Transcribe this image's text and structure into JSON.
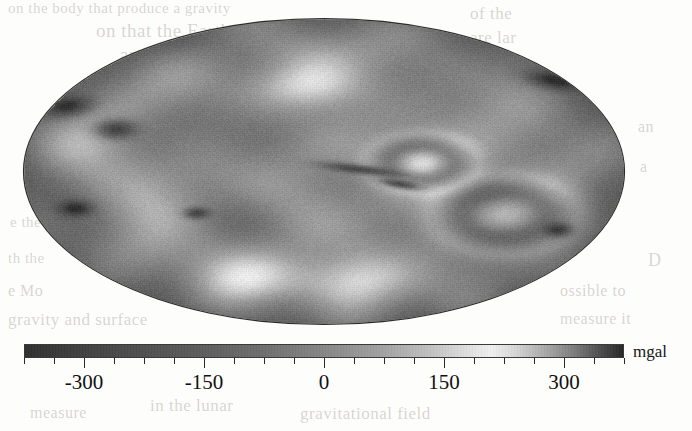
{
  "figure": {
    "kind": "gravity-anomaly-map",
    "projection": "Mollweide",
    "colormap": "grayscale-cyclic"
  },
  "colorbar": {
    "unit_label": "mgal",
    "min": -375,
    "max": 375,
    "tick_labels": [
      "-300",
      "-150",
      "0",
      "150",
      "300"
    ],
    "tick_values": [
      -300,
      -150,
      0,
      150,
      300
    ],
    "minor_step": 37.5,
    "low_color": "#2f2f2f",
    "mid_color": "#f0f0f0",
    "high_color": "#262626"
  },
  "bleed_through": [
    {
      "text": "on the body that produce a gravity",
      "x": 8,
      "y": 0,
      "size": 15,
      "mirror": false
    },
    {
      "text": "on that the Earth and could not",
      "x": 96,
      "y": 20,
      "size": 19,
      "mirror": false
    },
    {
      "text": "are large",
      "x": 120,
      "y": 44,
      "size": 19,
      "mirror": false
    },
    {
      "text": "of the",
      "x": 470,
      "y": 4,
      "size": 17,
      "mirror": false
    },
    {
      "text": "are lar",
      "x": 470,
      "y": 28,
      "size": 17,
      "mirror": false
    },
    {
      "text": "er and pro",
      "x": 430,
      "y": 60,
      "size": 17,
      "mirror": false
    },
    {
      "text": "an",
      "x": 638,
      "y": 118,
      "size": 16,
      "mirror": false
    },
    {
      "text": "a",
      "x": 640,
      "y": 158,
      "size": 16,
      "mirror": false
    },
    {
      "text": "e the",
      "x": 10,
      "y": 214,
      "size": 15,
      "mirror": false
    },
    {
      "text": "th the",
      "x": 8,
      "y": 250,
      "size": 15,
      "mirror": false
    },
    {
      "text": "e Mo",
      "x": 8,
      "y": 282,
      "size": 16,
      "mirror": false
    },
    {
      "text": "gravity and surface",
      "x": 8,
      "y": 310,
      "size": 17,
      "mirror": false
    },
    {
      "text": "D",
      "x": 648,
      "y": 250,
      "size": 18,
      "mirror": false
    },
    {
      "text": "ossible to",
      "x": 560,
      "y": 282,
      "size": 16,
      "mirror": false
    },
    {
      "text": "measure it",
      "x": 560,
      "y": 310,
      "size": 16,
      "mirror": false
    },
    {
      "text": "in the lunar",
      "x": 150,
      "y": 396,
      "size": 17,
      "mirror": false
    },
    {
      "text": "measure",
      "x": 30,
      "y": 404,
      "size": 16,
      "mirror": false
    },
    {
      "text": "gravitational field",
      "x": 300,
      "y": 404,
      "size": 17,
      "mirror": false
    }
  ],
  "chart_data": {
    "type": "heatmap",
    "title": "",
    "xlabel": "",
    "ylabel": "",
    "colorbar_label": "mgal",
    "colorbar_ticks": [
      -300,
      -150,
      0,
      150,
      300
    ],
    "value_range": [
      -375,
      375
    ],
    "projection": "Mollweide",
    "grid": false,
    "legend": "colorbar-below",
    "background_level": 15,
    "features": [
      {
        "name": "mascon-a",
        "cx": 0.073,
        "cy": 0.285,
        "rx": 0.04,
        "ry": 0.03,
        "rot": -28,
        "value": -330
      },
      {
        "name": "mascon-b",
        "cx": 0.152,
        "cy": 0.36,
        "rx": 0.032,
        "ry": 0.03,
        "rot": 0,
        "value": -340
      },
      {
        "name": "mascon-c",
        "cx": 0.085,
        "cy": 0.62,
        "rx": 0.027,
        "ry": 0.026,
        "rot": 0,
        "value": -325
      },
      {
        "name": "mascon-d",
        "cx": 0.287,
        "cy": 0.635,
        "rx": 0.02,
        "ry": 0.018,
        "rot": 0,
        "value": -300
      },
      {
        "name": "mascon-e",
        "cx": 0.883,
        "cy": 0.2,
        "rx": 0.045,
        "ry": 0.026,
        "rot": 24,
        "value": -350
      },
      {
        "name": "mascon-f",
        "cx": 0.89,
        "cy": 0.69,
        "rx": 0.022,
        "ry": 0.022,
        "rot": 0,
        "value": -320
      },
      {
        "name": "ridge-central",
        "cx": 0.56,
        "cy": 0.492,
        "rx": 0.06,
        "ry": 0.014,
        "rot": 14,
        "value": -310
      },
      {
        "name": "ridge-central-2",
        "cx": 0.625,
        "cy": 0.54,
        "rx": 0.032,
        "ry": 0.012,
        "rot": 22,
        "value": -300
      },
      {
        "name": "ring-right",
        "cx": 0.8,
        "cy": 0.64,
        "rx": 0.055,
        "ry": 0.058,
        "rot": 0,
        "value": 120
      },
      {
        "name": "ring-center",
        "cx": 0.662,
        "cy": 0.47,
        "rx": 0.042,
        "ry": 0.044,
        "rot": 0,
        "value": 110
      },
      {
        "name": "high-north",
        "cx": 0.47,
        "cy": 0.225,
        "rx": 0.12,
        "ry": 0.085,
        "rot": 0,
        "value": 150
      },
      {
        "name": "high-south",
        "cx": 0.5,
        "cy": 0.85,
        "rx": 0.15,
        "ry": 0.09,
        "rot": 0,
        "value": 140
      }
    ]
  }
}
